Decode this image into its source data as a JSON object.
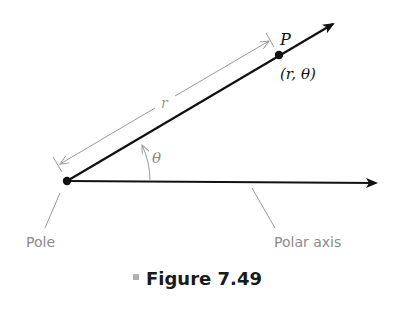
{
  "figure": {
    "caption_number": "Figure 7.49",
    "caption_bullet_color": "#b0b0b0"
  },
  "labels": {
    "point": "P",
    "coords": "(r, θ)",
    "radius": "r",
    "angle": "θ",
    "pole": "Pole",
    "polar_axis": "Polar axis"
  },
  "colors": {
    "main_line": "#111111",
    "annotation": "#9a9a9a",
    "label_text": "#8a8a8a"
  }
}
